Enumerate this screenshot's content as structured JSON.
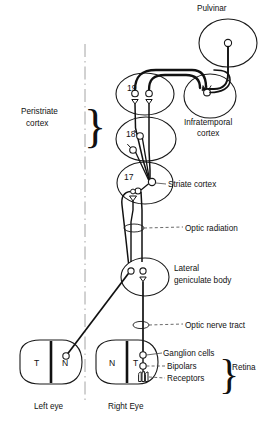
{
  "figure": {
    "title_visible": false,
    "type": "anatomical-schematic"
  },
  "labels": {
    "pulvinar": "Pulvinar",
    "infratemporal_cortex_line1": "Infratemporal",
    "infratemporal_cortex_line2": "cortex",
    "peristriate_cortex_line1": "Peristriate",
    "peristriate_cortex_line2": "cortex",
    "striate_cortex": "Striate cortex",
    "optic_radiation": "Optic radiation",
    "lateral_geniculate_line1": "Lateral",
    "lateral_geniculate_line2": "geniculate body",
    "optic_nerve_tract": "Optic nerve tract",
    "ganglion_cells": "Ganglion cells",
    "bipolars": "Bipolars",
    "receptors": "Receptors",
    "retina": "Retina",
    "left_eye": "Left eye",
    "right_eye": "Right Eye"
  },
  "areas": {
    "area_19": "19",
    "area_18": "18",
    "area_17": "17"
  },
  "retina_fields": {
    "left_eye_temporal": "T",
    "left_eye_nasal": "N",
    "right_eye_nasal": "N",
    "right_eye_temporal": "T"
  },
  "braces": {
    "peristriate_brace": "}",
    "retina_brace": "}"
  },
  "colors": {
    "ink": "#111111",
    "stroke": "#1a1a1a",
    "background": "#ffffff",
    "midline": "#999999"
  }
}
